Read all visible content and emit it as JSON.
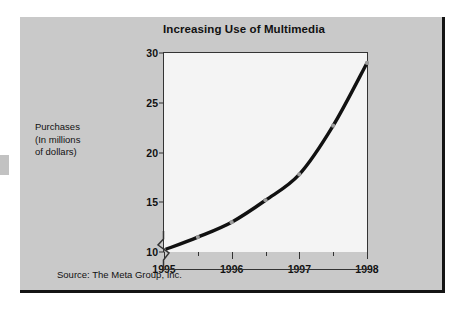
{
  "chart_data": {
    "type": "line",
    "title": "Increasing Use of Multimedia",
    "xlabel": "",
    "ylabel": "Purchases (In millions of dollars)",
    "ylabel_lines": [
      "Purchases",
      "(In millions",
      "of dollars)"
    ],
    "source": "Source: The Meta Group, Inc.",
    "x": [
      1995,
      1995.5,
      1996,
      1996.5,
      1997,
      1997.5,
      1998
    ],
    "values": [
      10.2,
      11.5,
      13.0,
      15.2,
      17.8,
      22.7,
      29.0
    ],
    "x_tick_labels": [
      "1995",
      "1996",
      "1997",
      "1998"
    ],
    "x_major_ticks": [
      1995,
      1996,
      1997,
      1998
    ],
    "x_minor_ticks": [
      1995.5,
      1996.5,
      1997.5
    ],
    "y_tick_labels": [
      "10",
      "15",
      "20",
      "25",
      "30"
    ],
    "y_ticks": [
      10,
      15,
      20,
      25,
      30
    ],
    "xlim": [
      1995,
      1998
    ],
    "ylim": [
      10,
      30
    ],
    "grid": false,
    "legend": false,
    "axis_break": true,
    "line_color": "#111111",
    "marker_color": "#9a9a9a",
    "plot_background": "#f4f4f4",
    "page_background": "#c9c9c9"
  }
}
